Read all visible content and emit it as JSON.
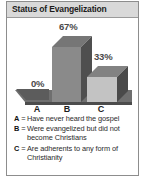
{
  "panel": {
    "title": "Status of Evangelization",
    "border_color": "#8d8d8d",
    "title_bar_color": "#d9d9d9"
  },
  "chart_data": {
    "type": "bar",
    "title": "Status of Evangelization",
    "categories": [
      "A",
      "B",
      "C"
    ],
    "values": [
      0,
      67,
      33
    ],
    "value_labels": [
      "0%",
      "67%",
      "33%"
    ],
    "xlabel": "",
    "ylabel": "",
    "ylim": [
      0,
      70
    ],
    "grid": false,
    "legend_position": "below",
    "style": "3d-isometric",
    "series": [
      {
        "name": "Percent of world population",
        "values": [
          0,
          67,
          33
        ]
      }
    ],
    "bar_colors": [
      "#5c5c5c",
      "#8a8a8a",
      "#c3c3c3"
    ],
    "legend": [
      {
        "key": "A",
        "eq": "=",
        "text": "Have never heard the gospel"
      },
      {
        "key": "B",
        "eq": "=",
        "text": "Were evangelized but did not become Christians"
      },
      {
        "key": "C",
        "eq": "=",
        "text": "Are adherents to any form of Christianity"
      }
    ]
  }
}
